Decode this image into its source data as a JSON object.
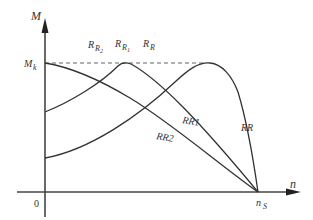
{
  "diagram": {
    "y_axis_label": "M",
    "x_axis_label": "n",
    "origin_label": "0",
    "mk_label": {
      "main": "M",
      "sub": "k"
    },
    "ns_label": {
      "main": "n",
      "sub": "S"
    },
    "top_labels": [
      {
        "main": "R",
        "sub": "R",
        "sub2": "2"
      },
      {
        "main": "R",
        "sub": "R",
        "sub2": "1"
      },
      {
        "main": "R",
        "sub": "R",
        "sub2": ""
      }
    ],
    "curve_labels": [
      {
        "text": "RR1"
      },
      {
        "text": "RR2"
      },
      {
        "text": "RR"
      }
    ],
    "colors": {
      "line": "#333333",
      "axis": "#444444",
      "dash": "#555555"
    }
  }
}
